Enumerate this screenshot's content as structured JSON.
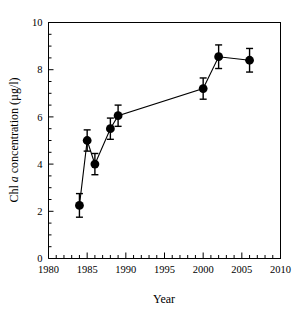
{
  "chart_data": {
    "type": "line",
    "title": "",
    "xlabel": "Year",
    "ylabel": "Chl a concentration (µg/l)",
    "ylabel_parts": {
      "pre": "Chl ",
      "italic": "a",
      "post": " concentration (µg/l)"
    },
    "xlim": [
      1980,
      2010
    ],
    "ylim": [
      0,
      10
    ],
    "xticks": [
      1980,
      1985,
      1990,
      1995,
      2000,
      2005,
      2010
    ],
    "xtick_labels": [
      "1980",
      "1985",
      "1990",
      "1995",
      "2000",
      "2005",
      "2010"
    ],
    "xminor_step": 1,
    "yticks": [
      0,
      2,
      4,
      6,
      8,
      10
    ],
    "ytick_labels": [
      "0",
      "2",
      "4",
      "6",
      "8",
      "10"
    ],
    "yminor_step": 0.5,
    "grid": false,
    "legend": false,
    "marker": "filled-circle",
    "marker_color": "#000000",
    "line_color": "#000000",
    "errorbar_color": "#000000",
    "x": [
      1984,
      1985,
      1986,
      1988,
      1989,
      2000,
      2002,
      2006
    ],
    "y": [
      2.25,
      5.0,
      4.0,
      5.5,
      6.05,
      7.2,
      8.55,
      8.4
    ],
    "yerr": [
      0.5,
      0.45,
      0.45,
      0.45,
      0.45,
      0.45,
      0.5,
      0.5
    ],
    "points": [
      {
        "year": 1984,
        "value": 2.25,
        "err": 0.5
      },
      {
        "year": 1985,
        "value": 5.0,
        "err": 0.45
      },
      {
        "year": 1986,
        "value": 4.0,
        "err": 0.45
      },
      {
        "year": 1988,
        "value": 5.5,
        "err": 0.45
      },
      {
        "year": 1989,
        "value": 6.05,
        "err": 0.45
      },
      {
        "year": 2000,
        "value": 7.2,
        "err": 0.45
      },
      {
        "year": 2002,
        "value": 8.55,
        "err": 0.5
      },
      {
        "year": 2006,
        "value": 8.4,
        "err": 0.5
      }
    ]
  },
  "axes": {
    "x_title": "Year",
    "y_title": "Chl a concentration (µg/l)"
  }
}
